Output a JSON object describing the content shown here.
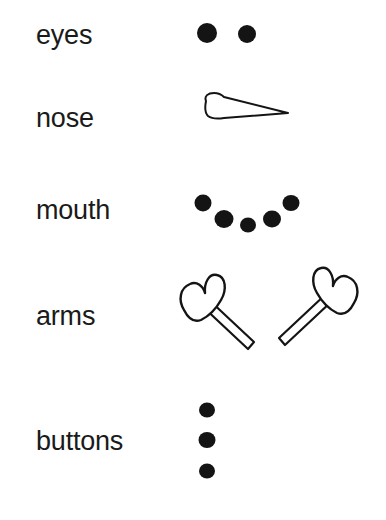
{
  "page": {
    "background_color": "#ffffff",
    "ink_color": "#141414",
    "width": 386,
    "height": 520
  },
  "rows": [
    {
      "key": "eyes",
      "label": "eyes",
      "art_name": "eyes-art",
      "description": "two filled black dots side by side"
    },
    {
      "key": "nose",
      "label": "nose",
      "art_name": "nose-art",
      "description": "outlined carrot cone tapering to a point on the right"
    },
    {
      "key": "mouth",
      "label": "mouth",
      "art_name": "mouth-art",
      "description": "five filled black dots arranged in a smiling arc"
    },
    {
      "key": "arms",
      "label": "arms",
      "art_name": "arms-art",
      "description": "two outlined mitten-and-stick arms angled outward"
    },
    {
      "key": "buttons",
      "label": "buttons",
      "art_name": "buttons-art",
      "description": "three filled black dots stacked vertically"
    }
  ],
  "shapes": {
    "eyes": {
      "dots": [
        {
          "cx": 57,
          "cy": 33,
          "rx": 10,
          "ry": 10
        },
        {
          "cx": 97,
          "cy": 34,
          "rx": 9,
          "ry": 9
        }
      ]
    },
    "nose": {
      "outline_points": "56,20 60,15 66,14 72,15 138,33 72,37 63,37 57,33 55,27",
      "tip_x": 138,
      "tip_y": 33
    },
    "mouth": {
      "dots": [
        {
          "cx": 53,
          "cy": 23,
          "rx": 8.5,
          "ry": 8.5
        },
        {
          "cx": 74,
          "cy": 39,
          "rx": 9.5,
          "ry": 9.0
        },
        {
          "cx": 98,
          "cy": 45,
          "rx": 8.0,
          "ry": 7.5
        },
        {
          "cx": 122,
          "cy": 39,
          "rx": 9.0,
          "ry": 8.5
        },
        {
          "cx": 141,
          "cy": 23,
          "rx": 8.5,
          "ry": 8.0
        }
      ]
    },
    "arms": {
      "left": {
        "mitten_path": "M 33 47 C 28 36 30 24 40 20 C 47 17 53 22 55 29 C 55 19 60 10 68 12 C 76 14 77 26 72 36 C 68 44 60 52 52 56 C 45 58 37 55 33 47 Z",
        "stick_path": "M 60 36 L 105 77 L 99 84 L 54 44 Z"
      },
      "right": {
        "mitten_path": "M 206 42 C 211 31 209 19 199 15 C 192 12 186 17 184 24 C 184 14 179 5 171 7 C 163 9 162 21 167 31 C 171 39 179 47 187 51 C 194 53 202 50 206 42 Z",
        "stick_path": "M 179 31 L 134 72 L 140 79 L 185 39 Z"
      }
    },
    "buttons": {
      "dots": [
        {
          "cx": 57,
          "cy": 20,
          "rx": 8.0,
          "ry": 7.5
        },
        {
          "cx": 57,
          "cy": 50,
          "rx": 8.5,
          "ry": 8.0
        },
        {
          "cx": 57,
          "cy": 81,
          "rx": 8.0,
          "ry": 7.5
        }
      ]
    }
  }
}
